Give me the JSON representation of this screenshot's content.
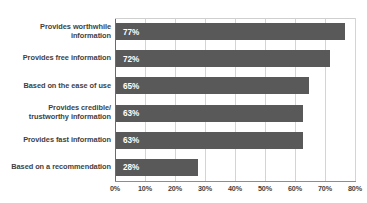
{
  "chart_data": {
    "type": "bar",
    "orientation": "horizontal",
    "title": "",
    "xlabel": "",
    "ylabel": "",
    "xlim": [
      0,
      80
    ],
    "grid": true,
    "legend": "none",
    "categories": [
      "Provides worthwhile information",
      "Provides free information",
      "Based on the ease of use",
      "Provides credible/ trustworthy information",
      "Provides fast information",
      "Based on a recommendation"
    ],
    "category_lines": [
      [
        "Provides worthwhile",
        "information"
      ],
      [
        "Provides free information"
      ],
      [
        "Based on the ease of use"
      ],
      [
        "Provides credible/",
        "trustworthy information"
      ],
      [
        "Provides fast information"
      ],
      [
        "Based on a recommendation"
      ]
    ],
    "values": [
      77,
      72,
      65,
      63,
      63,
      28
    ],
    "data_labels": [
      "77%",
      "72%",
      "65%",
      "63%",
      "63%",
      "28%"
    ],
    "xticks": [
      0,
      10,
      20,
      30,
      40,
      50,
      60,
      70,
      80
    ],
    "xtick_labels": [
      "0%",
      "10%",
      "20%",
      "30%",
      "40%",
      "50%",
      "60%",
      "70%",
      "80%"
    ],
    "bar_color": "#595959",
    "data_label_color": "#ffffff",
    "category_label_color": "#3f3f3f",
    "gridline_color": "#d4d4d4",
    "axis_color": "#6b6b6b",
    "background_color": "#ffffff",
    "title_fragment": "■ ■■ ■"
  }
}
